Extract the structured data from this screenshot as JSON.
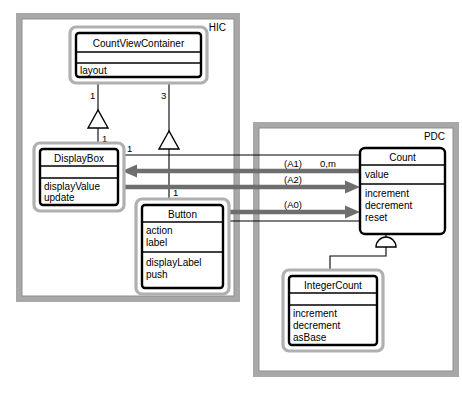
{
  "diagram": {
    "subjects": [
      {
        "id": "hic",
        "label": "HIC"
      },
      {
        "id": "pdc",
        "label": "PDC"
      }
    ],
    "classes": [
      {
        "id": "countviewcontainer",
        "name": "CountViewContainer",
        "attributes": [
          "layout"
        ],
        "operations": [],
        "subject": "HIC",
        "has_halo": true
      },
      {
        "id": "displaybox",
        "name": "DisplayBox",
        "attributes": [],
        "operations": [
          "displayValue",
          "update"
        ],
        "subject": "HIC",
        "has_halo": true
      },
      {
        "id": "button",
        "name": "Button",
        "attributes": [
          "action",
          "label"
        ],
        "operations": [
          "displayLabel",
          "push"
        ],
        "subject": "HIC",
        "has_halo": true
      },
      {
        "id": "count",
        "name": "Count",
        "attributes": [
          "value"
        ],
        "operations": [
          "increment",
          "decrement",
          "reset"
        ],
        "subject": "PDC",
        "has_halo": false
      },
      {
        "id": "integercount",
        "name": "IntegerCount",
        "attributes": [],
        "operations": [
          "increment",
          "decrement",
          "asBase"
        ],
        "subject": "PDC",
        "has_halo": true
      }
    ],
    "connections": [
      {
        "id": "cvc-displaybox",
        "kind": "whole-part",
        "from": "CountViewContainer",
        "to": "DisplayBox",
        "whole_multiplicity": "1",
        "part_multiplicity": "1"
      },
      {
        "id": "cvc-button",
        "kind": "whole-part",
        "from": "CountViewContainer",
        "to": "Button",
        "whole_multiplicity": "3",
        "part_multiplicity": "1"
      },
      {
        "id": "count-integercount",
        "kind": "generalization-specialization",
        "from": "Count",
        "to": "IntegerCount",
        "whole_multiplicity": "",
        "part_multiplicity": ""
      },
      {
        "id": "displaybox-count-assoc",
        "kind": "instance-connection",
        "from": "DisplayBox",
        "to": "Count",
        "whole_multiplicity": "1",
        "part_multiplicity": "0,m"
      },
      {
        "id": "button-count-assoc",
        "kind": "instance-connection",
        "from": "Button",
        "to": "Count",
        "whole_multiplicity": "1",
        "part_multiplicity": ""
      }
    ],
    "messages": [
      {
        "id": "a1",
        "label": "(A1)",
        "direction": "left",
        "from": "Count",
        "to": "DisplayBox"
      },
      {
        "id": "a2",
        "label": "(A2)",
        "direction": "right",
        "from": "DisplayBox",
        "to": "Count"
      },
      {
        "id": "a0",
        "label": "(A0)",
        "direction": "right",
        "from": "Button",
        "to": "Count"
      }
    ],
    "multiplicity_labels": {
      "cvc_to_displaybox": "1",
      "displaybox_part": "1",
      "cvc_to_button": "3",
      "button_part": "1",
      "displaybox_assoc": "1",
      "count_assoc": "0,m",
      "button_assoc": "1"
    },
    "colors": {
      "subject_frame": "#a8a8a8",
      "class_halo": "#b0b0b0",
      "class_border": "#000000",
      "message_arrow": "#6e6e6e",
      "background": "#ffffff"
    }
  }
}
